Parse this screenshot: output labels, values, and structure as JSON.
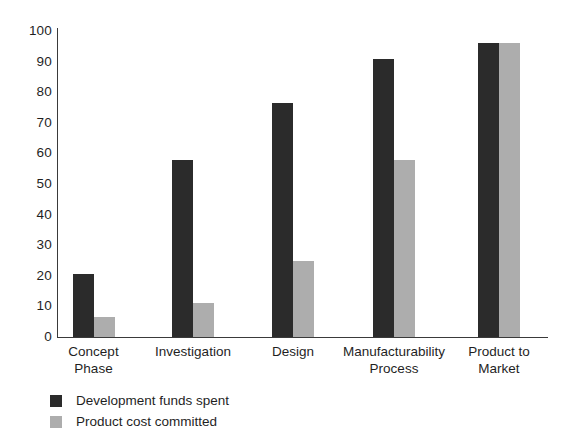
{
  "chart_data": {
    "type": "bar",
    "title": "",
    "subtitle": "",
    "xlabel": "",
    "ylabel": "",
    "ylim": [
      0,
      100
    ],
    "yticks": [
      0,
      10,
      20,
      30,
      40,
      50,
      60,
      70,
      80,
      90,
      100
    ],
    "grid": false,
    "legend_position": "bottom-left",
    "categories": [
      "Concept\nPhase",
      "Investigation",
      "Design",
      "Manufacturability\nProcess",
      "Product to\nMarket"
    ],
    "series": [
      {
        "name": "Development funds spent",
        "color": "#2b2b2b",
        "values": [
          20.5,
          58,
          76.5,
          91,
          96
        ]
      },
      {
        "name": "Product cost committed",
        "color": "#adadad",
        "values": [
          6.5,
          11,
          25,
          58,
          96
        ]
      }
    ]
  },
  "legend": {
    "items": [
      {
        "label": "Development funds spent",
        "swatch": "dark"
      },
      {
        "label": "Product cost committed",
        "swatch": "light"
      }
    ]
  },
  "colors": {
    "dark_bar": "#2b2b2b",
    "light_bar": "#adadad",
    "axis": "#3a3a3a",
    "text": "#1f1f1f",
    "background": "#ffffff"
  }
}
